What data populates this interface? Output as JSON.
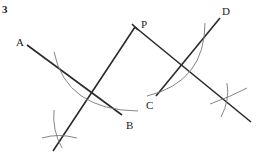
{
  "figure": {
    "number": "3",
    "labels": {
      "A": "A",
      "B": "B",
      "C": "C",
      "D": "D",
      "P": "P"
    }
  }
}
